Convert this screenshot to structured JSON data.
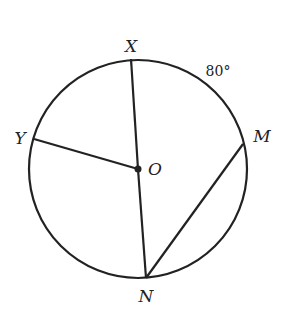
{
  "diagram": {
    "type": "circle-geometry",
    "center": {
      "label": "O",
      "x": 138,
      "y": 169
    },
    "radius": 109,
    "points": {
      "X": {
        "label": "X",
        "x": 131,
        "y": 59
      },
      "Y": {
        "label": "Y",
        "x": 34,
        "y": 139
      },
      "M": {
        "label": "M",
        "x": 243,
        "y": 144
      },
      "N": {
        "label": "N",
        "x": 146,
        "y": 278
      }
    },
    "segments": [
      {
        "from": "O",
        "to": "X"
      },
      {
        "from": "O",
        "to": "Y"
      },
      {
        "from": "O",
        "to": "N"
      },
      {
        "from": "N",
        "to": "M"
      }
    ],
    "arc_annotation": {
      "arc": "XM",
      "text": "80°"
    },
    "labels": {
      "X": "X",
      "Y": "Y",
      "M": "M",
      "N": "N",
      "O": "O",
      "arc_measure": "80°"
    },
    "colors": {
      "stroke": "#222222",
      "background": "#ffffff"
    }
  }
}
